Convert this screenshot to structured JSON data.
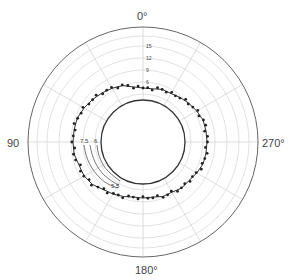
{
  "chart_data": {
    "type": "scatter",
    "subtype": "polar",
    "title": "",
    "angle_labels": [
      {
        "angle": 0,
        "label": "0°"
      },
      {
        "angle": 90,
        "label": "90°"
      },
      {
        "angle": 180,
        "label": "180°"
      },
      {
        "angle": 270,
        "label": "270°"
      }
    ],
    "angle_direction": "counterclockwise",
    "angle_zero": "top",
    "spoke_step_deg": 30,
    "radial_ticks": [
      6,
      9,
      12,
      15
    ],
    "radial_tick_labels": [
      "6",
      "9",
      "12",
      "15"
    ],
    "rlim": [
      -1.5,
      19.75
    ],
    "inner_circle_value": 1.5,
    "grid": true,
    "series": [
      {
        "name": "measured points",
        "angles": [
          0,
          10,
          20,
          30,
          40,
          50,
          60,
          70,
          80,
          90,
          100,
          110,
          120,
          130,
          140,
          150,
          160,
          170,
          180,
          190,
          200,
          210,
          220,
          230,
          240,
          250,
          260,
          270,
          280,
          290,
          300,
          310,
          320,
          330,
          340,
          350
        ],
        "values": [
          4.5,
          5.0,
          6.0,
          6.5,
          7.0,
          7.5,
          8.0,
          8.5,
          8.5,
          8.5,
          8.5,
          8.0,
          8.0,
          7.5,
          6.5,
          6.0,
          5.5,
          5.0,
          5.0,
          5.0,
          5.5,
          5.5,
          6.0,
          6.0,
          6.5,
          7.0,
          7.0,
          7.0,
          7.0,
          7.0,
          6.5,
          6.0,
          5.5,
          5.0,
          5.0,
          4.5
        ]
      }
    ],
    "contour_labels": [
      "7.5",
      "6",
      "5.5"
    ]
  },
  "labels": {
    "a0": "0°",
    "a90": "90",
    "a180": "180°",
    "a270": "270°",
    "r6": "6",
    "r9": "9",
    "r12": "12",
    "r15": "15",
    "c75": "7.5",
    "c6": "6",
    "c55": "5.5"
  }
}
